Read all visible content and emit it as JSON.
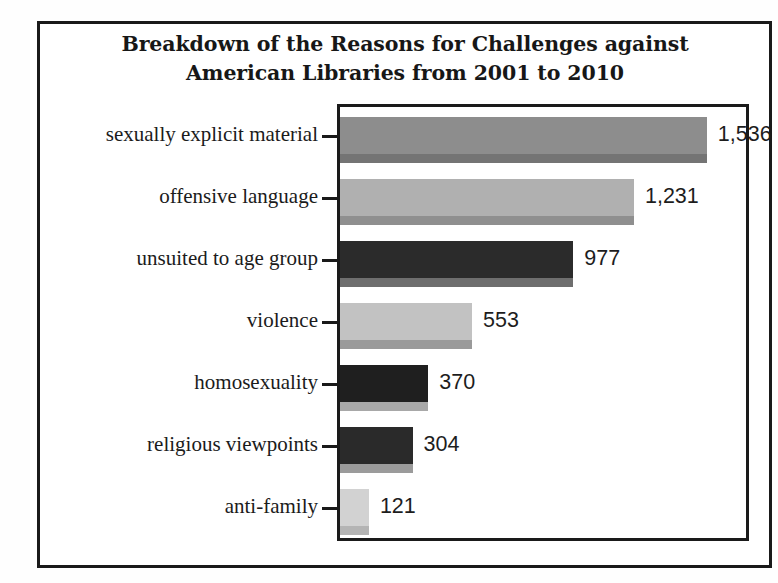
{
  "figure": {
    "background_color": "#ffffff",
    "frame_color": "#1a1a1a"
  },
  "title": {
    "line1": "Breakdown of the Reasons for Challenges against",
    "line2": "American Libraries from  2001 to 2010"
  },
  "chart_data": {
    "type": "bar",
    "orientation": "horizontal",
    "title": "Breakdown of the Reasons for Challenges against American Libraries from  2001 to 2010",
    "xlabel": "",
    "ylabel": "",
    "grid": false,
    "legend": false,
    "xlim": [
      0,
      1700
    ],
    "categories": [
      "sexually explicit material",
      "offensive language",
      "unsuited to age group",
      "violence",
      "homosexuality",
      "religious viewpoints",
      "anti-family"
    ],
    "values": [
      1536,
      1231,
      977,
      553,
      370,
      304,
      121
    ],
    "value_labels": [
      "1,536",
      "1,231",
      "977",
      "553",
      "370",
      "304",
      "121"
    ],
    "bar_colors": [
      "#8d8d8d",
      "#b0b0b0",
      "#2b2b2b",
      "#c2c2c2",
      "#1f1f1f",
      "#2a2a2a",
      "#d2d2d2"
    ],
    "bar_shadow_colors": [
      "#747474",
      "#8f8f8f",
      "#6e6e6e",
      "#9a9a9a",
      "#a8a8a8",
      "#9b9b9b",
      "#b4b4b4"
    ]
  }
}
